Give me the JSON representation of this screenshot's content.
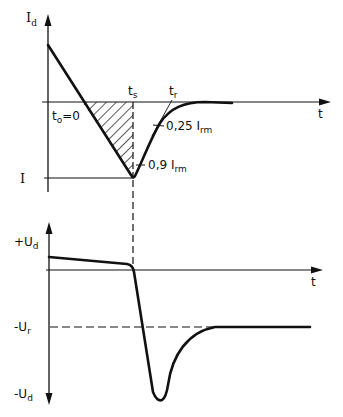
{
  "diagram": {
    "upper_plot": {
      "y_axis_label": "I",
      "y_axis_label_sub": "d",
      "x_axis_label": "t",
      "level_label": "I",
      "t0_label": "t",
      "t0_label_sub": "o",
      "t0_value": "=0",
      "ts_label": "t",
      "ts_label_sub": "s",
      "tr_label": "t",
      "tr_label_sub": "r",
      "marker_025_value": "0,25 I",
      "marker_025_sub": "rm",
      "marker_09_value": "0,9 I",
      "marker_09_sub": "rm"
    },
    "lower_plot": {
      "pos_label": "+U",
      "pos_label_sub": "d",
      "x_axis_label": "t",
      "ur_label": "-U",
      "ur_label_sub": "r",
      "neg_label": "-U",
      "neg_label_sub": "d"
    },
    "colors": {
      "line": "#111111",
      "background": "#ffffff"
    }
  }
}
